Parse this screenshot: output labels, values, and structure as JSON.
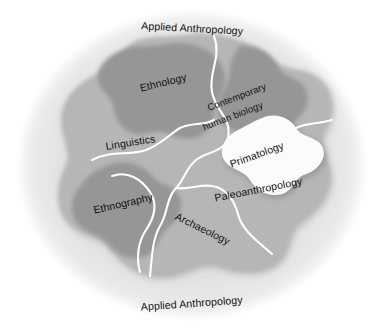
{
  "diagram": {
    "title": "Applied Anthropology",
    "type": "venn-organic-regions",
    "outer_labels": [
      {
        "id": "applied-top",
        "text": "Applied Anthropology",
        "position": "top",
        "rotation": 3
      },
      {
        "id": "applied-bottom",
        "text": "Applied Anthropology",
        "position": "bottom",
        "rotation": -4
      }
    ],
    "regions": [
      {
        "id": "ethnology",
        "label": "Ethnology",
        "tone": "dark",
        "rotation": -14
      },
      {
        "id": "contemporary-human-biology",
        "label": "Contemporary human biology",
        "line1": "Contemporary",
        "line2": "human biology",
        "tone": "dark",
        "rotation": -21
      },
      {
        "id": "linguistics",
        "label": "Linguistics",
        "tone": "mid",
        "rotation": -9
      },
      {
        "id": "primatology",
        "label": "Primatology",
        "tone": "white",
        "rotation": -20
      },
      {
        "id": "paleoanthropology",
        "label": "Paleoanthropology",
        "tone": "mid",
        "rotation": -11
      },
      {
        "id": "ethnography",
        "label": "Ethnography",
        "tone": "dark",
        "rotation": -13
      },
      {
        "id": "archaeology",
        "label": "Archaeology",
        "tone": "mid",
        "rotation": 26
      }
    ],
    "colors": {
      "background": "#ffffff",
      "outer_ring": "#e2e2e2",
      "mid_field": "#b6b6b6",
      "dark_blob": "#969696",
      "white_lobe": "#fbfbfb",
      "divider": "#ffffff",
      "text": "#111111"
    }
  }
}
